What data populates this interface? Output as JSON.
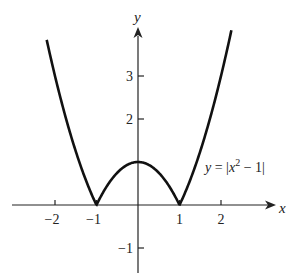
{
  "chart_data": {
    "type": "line",
    "title": "",
    "xlabel": "x",
    "ylabel": "y",
    "function": "y = |x^2 - 1|",
    "annotation": "y = |x² − 1|",
    "x_ticks": [
      -2,
      -1,
      1,
      2
    ],
    "x_tick_labels": [
      "−2",
      "−1",
      "1",
      "2"
    ],
    "y_ticks": [
      3,
      2,
      -1
    ],
    "y_tick_labels": [
      "3",
      "2",
      "−1"
    ],
    "xlim": [
      -3.3,
      3.2
    ],
    "ylim": [
      -1.6,
      4.7
    ],
    "grid": false,
    "series": [
      {
        "name": "y = |x^2 - 1|",
        "x": [
          -2.2,
          -2.0,
          -1.5,
          -1.0,
          -0.5,
          0.0,
          0.5,
          1.0,
          1.5,
          2.0,
          2.25
        ],
        "y": [
          3.84,
          3.0,
          1.25,
          0.0,
          0.75,
          1.0,
          0.75,
          0.0,
          1.25,
          3.0,
          4.06
        ]
      }
    ],
    "color": "#111111"
  },
  "labels": {
    "x_axis": "x",
    "y_axis": "y",
    "eq_y": "y",
    "eq_eq": " = |",
    "eq_x": "x",
    "eq_exp": "2",
    "eq_rest": " − 1|"
  }
}
